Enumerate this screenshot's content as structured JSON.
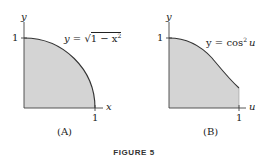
{
  "figure": {
    "caption": "FIGURE 5",
    "colors": {
      "fill": "#d4d4d4",
      "stroke": "#333333",
      "text": "#222222"
    },
    "panels": [
      {
        "label": "(A)",
        "x_axis_label": "x",
        "y_axis_label": "y",
        "x_tick": "1",
        "y_tick": "1",
        "equation_prefix": "y = ",
        "equation_radicand": "1 − x",
        "equation_exp": "2",
        "curve": "y = sqrt(1 - x^2)"
      },
      {
        "label": "(B)",
        "x_axis_label": "u",
        "y_axis_label": "y",
        "x_tick": "1",
        "y_tick": "1",
        "equation_prefix": "y = cos",
        "equation_exp": "2",
        "equation_var": "u",
        "curve": "y = cos^2 u"
      }
    ]
  }
}
